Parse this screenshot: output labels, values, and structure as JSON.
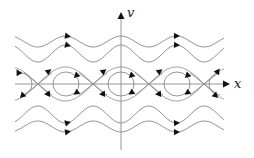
{
  "diagram": {
    "type": "phase-portrait",
    "axes": {
      "x_label": "x",
      "y_label": "v",
      "origin": [
        121,
        84
      ],
      "x_range_px": [
        15,
        230
      ],
      "y_range_px": [
        12,
        150
      ]
    },
    "colors": {
      "curve": "#8a8a8a",
      "arrow": "#111111",
      "label": "#222222"
    },
    "geometry": {
      "period_px": 55.5,
      "centers_x": [
        66,
        121,
        177
      ],
      "saddles_x": [
        38,
        93,
        149,
        204
      ],
      "inner_orbit": {
        "rx": 13,
        "ry": 12
      },
      "separatrix_half_height": 17
    },
    "rotating_trajectories": [
      {
        "name": "upper-outer",
        "at_center": 36,
        "at_saddle": 47,
        "direction": "right",
        "arrows_x": [
          68,
          177
        ]
      },
      {
        "name": "upper-inner",
        "at_center": 45,
        "at_saddle": 62,
        "direction": "right",
        "arrows_x": [
          68,
          177
        ]
      },
      {
        "name": "lower-inner",
        "at_center": 123,
        "at_saddle": 106,
        "direction": "right",
        "arrows_x": [
          68,
          177
        ]
      },
      {
        "name": "lower-outer",
        "at_center": 132,
        "at_saddle": 121,
        "direction": "right",
        "arrows_x": [
          68,
          177
        ]
      }
    ],
    "flow_direction": "clockwise",
    "equilibria": {
      "centers": "stable (closed orbits)",
      "saddles": "unstable"
    }
  }
}
